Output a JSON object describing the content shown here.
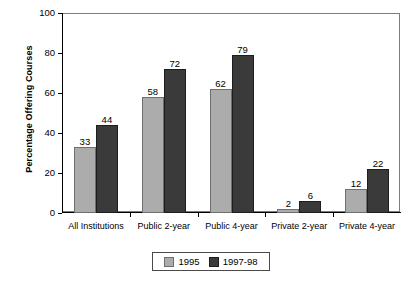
{
  "chart_data": {
    "type": "bar",
    "title": "",
    "xlabel": "",
    "ylabel": "Percentage Offering Courses",
    "ylim": [
      0,
      100
    ],
    "yticks": [
      0,
      20,
      40,
      60,
      80,
      100
    ],
    "ytick_labels": [
      "0",
      "20",
      "40",
      "60",
      "80",
      "100"
    ],
    "grid": false,
    "legend_position": "bottom-center",
    "categories": [
      "All Institutions",
      "Public 2-year",
      "Public 4-year",
      "Private 2-year",
      "Private 4-year"
    ],
    "series": [
      {
        "name": "1995",
        "color": "#acacac",
        "values": [
          33,
          58,
          62,
          2,
          12
        ],
        "value_labels": [
          "33",
          "58",
          "62",
          "2",
          "12"
        ]
      },
      {
        "name": "1997-98",
        "color": "#3a3a3a",
        "values": [
          44,
          72,
          79,
          6,
          22
        ],
        "value_labels": [
          "44",
          "72",
          "79",
          "6",
          "22"
        ]
      }
    ]
  },
  "legend": {
    "entries": [
      {
        "label": "1995",
        "swatch": "light-gray-swatch"
      },
      {
        "label": "1997-98",
        "swatch": "dark-gray-swatch"
      }
    ]
  },
  "colors": {
    "series_1995": "#acacac",
    "series_1997_98": "#3a3a3a",
    "axis": "#000000",
    "frame": "#7d7d7d",
    "background": "#ffffff",
    "text": "#000000"
  }
}
